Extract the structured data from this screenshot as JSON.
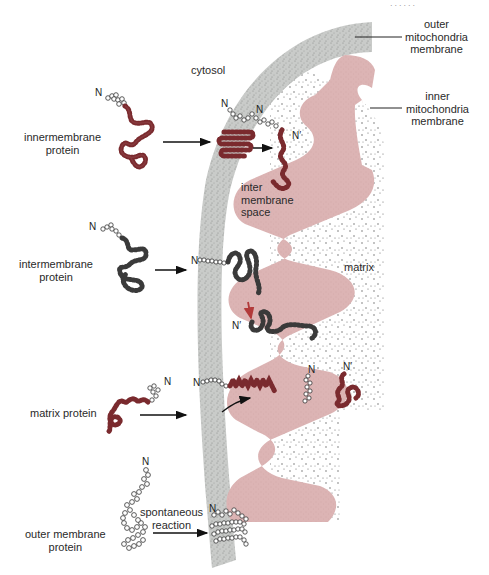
{
  "header_text": "· · · · · ·",
  "regions": {
    "cytosol": "cytosol",
    "intermembrane_space": [
      "inter",
      "membrane",
      "space"
    ],
    "matrix": "matrix"
  },
  "membranes": {
    "outer": [
      "outer",
      "mitochondria",
      "membrane"
    ],
    "inner": [
      "inner",
      "mitochondria",
      "membrane"
    ]
  },
  "proteins": [
    {
      "id": "innermembrane",
      "label": [
        "innermembrane",
        "protein"
      ],
      "n_label": "N",
      "destination_labels": [
        "N",
        "N",
        "N′"
      ]
    },
    {
      "id": "intermembrane",
      "label": [
        "intermembrane",
        "protein"
      ],
      "n_label": "N",
      "destination_labels": [
        "N",
        "N′"
      ]
    },
    {
      "id": "matrix",
      "label": [
        "matrix protein"
      ],
      "n_label": "N",
      "destination_labels": [
        "N",
        "N",
        "N′"
      ]
    },
    {
      "id": "outer_membrane",
      "label": [
        "outer membrane",
        "protein"
      ],
      "n_label": "N",
      "destination_labels": [
        "N"
      ],
      "arrow_note": [
        "spontaneous",
        "reaction"
      ]
    }
  ],
  "colors": {
    "outer_membrane": "#c9cbc9",
    "inner_membrane": "#dcb2b2",
    "protein_dark_red": "#7a2a2e",
    "protein_dark": "#3a3a3a",
    "signal_white": "#ffffff",
    "red_arrow": "#b23a3a",
    "matrix_dots": "#555555"
  }
}
